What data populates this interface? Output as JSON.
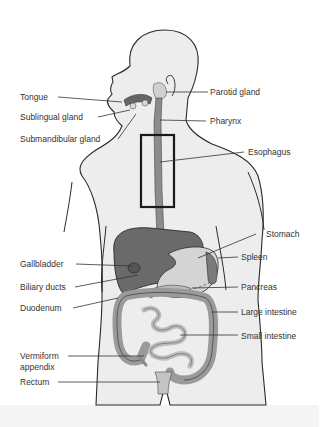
{
  "figure": {
    "colors": {
      "outline": "#2a2a2a",
      "skin": "#ededed",
      "organ_dark": "#6a6a6a",
      "organ_mid": "#9a9a9a",
      "organ_light": "#c8c8c8",
      "leader_line": "#333333",
      "highlight_box": "#1a1a1a"
    }
  },
  "labels": {
    "left": [
      {
        "id": "tongue",
        "text": "Tongue"
      },
      {
        "id": "sublingual",
        "text": "Sublingual gland"
      },
      {
        "id": "submandibular",
        "text": "Submandibular gland"
      },
      {
        "id": "gallbladder",
        "text": "Gallbladder"
      },
      {
        "id": "biliary",
        "text": "Biliary ducts"
      },
      {
        "id": "duodenum",
        "text": "Duodenum"
      },
      {
        "id": "appendix_1",
        "text": "Vermiform"
      },
      {
        "id": "appendix_2",
        "text": "appendix"
      },
      {
        "id": "rectum",
        "text": "Rectum"
      }
    ],
    "right": [
      {
        "id": "parotid",
        "text": "Parotid gland"
      },
      {
        "id": "pharynx",
        "text": "Pharynx"
      },
      {
        "id": "esophagus",
        "text": "Esophagus"
      },
      {
        "id": "stomach",
        "text": "Stomach"
      },
      {
        "id": "spleen",
        "text": "Spleen"
      },
      {
        "id": "pancreas",
        "text": "Pancreas"
      },
      {
        "id": "large_intestine",
        "text": "Large intestine"
      },
      {
        "id": "small_intestine",
        "text": "Small intestine"
      }
    ]
  }
}
